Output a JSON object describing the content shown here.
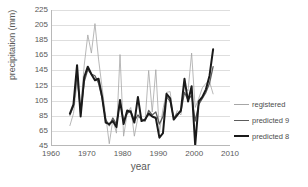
{
  "chart_data": {
    "type": "line",
    "title": "",
    "xlabel": "year",
    "ylabel": "precipitation (mm)",
    "xlim": [
      1960,
      2010
    ],
    "ylim": [
      45,
      225
    ],
    "xticks": [
      1960,
      1970,
      1980,
      1990,
      2000,
      2010
    ],
    "yticks": [
      45,
      65,
      85,
      105,
      125,
      145,
      165,
      185,
      205,
      225
    ],
    "grid": "horizontal",
    "legend_position": "right",
    "x": [
      1965,
      1966,
      1967,
      1968,
      1969,
      1970,
      1971,
      1972,
      1973,
      1974,
      1975,
      1976,
      1977,
      1978,
      1979,
      1980,
      1981,
      1982,
      1983,
      1984,
      1985,
      1986,
      1987,
      1988,
      1989,
      1990,
      1991,
      1992,
      1993,
      1994,
      1995,
      1996,
      1997,
      1998,
      1999,
      2000,
      2001,
      2002,
      2003,
      2004,
      2005
    ],
    "series": [
      {
        "name": "registered",
        "color": "#a6a6a6",
        "width": 0.8,
        "values": [
          72,
          88,
          128,
          96,
          152,
          192,
          168,
          207,
          160,
          122,
          85,
          48,
          80,
          62,
          166,
          58,
          88,
          96,
          58,
          83,
          82,
          78,
          145,
          90,
          146,
          63,
          94,
          116,
          117,
          80,
          92,
          86,
          125,
          118,
          168,
          96,
          108,
          122,
          128,
          130,
          114
        ]
      },
      {
        "name": "predicted 9",
        "color": "#5c5c5c",
        "width": 1.3,
        "values": [
          86,
          98,
          140,
          88,
          130,
          146,
          140,
          138,
          128,
          108,
          80,
          72,
          82,
          74,
          104,
          78,
          88,
          92,
          78,
          86,
          80,
          78,
          92,
          86,
          90,
          74,
          84,
          110,
          104,
          82,
          88,
          90,
          116,
          106,
          112,
          78,
          100,
          108,
          116,
          128,
          150
        ]
      },
      {
        "name": "predicted 8",
        "color": "#1a1a1a",
        "width": 2.0,
        "values": [
          88,
          100,
          152,
          84,
          136,
          150,
          140,
          132,
          134,
          110,
          76,
          74,
          78,
          70,
          106,
          74,
          92,
          90,
          76,
          110,
          78,
          80,
          88,
          84,
          82,
          56,
          62,
          114,
          108,
          80,
          86,
          92,
          134,
          104,
          124,
          46,
          104,
          110,
          120,
          138,
          173
        ]
      }
    ]
  },
  "legend": {
    "entries": [
      {
        "label": "registered"
      },
      {
        "label": "predicted 9"
      },
      {
        "label": "predicted 8"
      }
    ]
  },
  "axes": {
    "x_title": "year",
    "y_title": "precipitation (mm)"
  }
}
